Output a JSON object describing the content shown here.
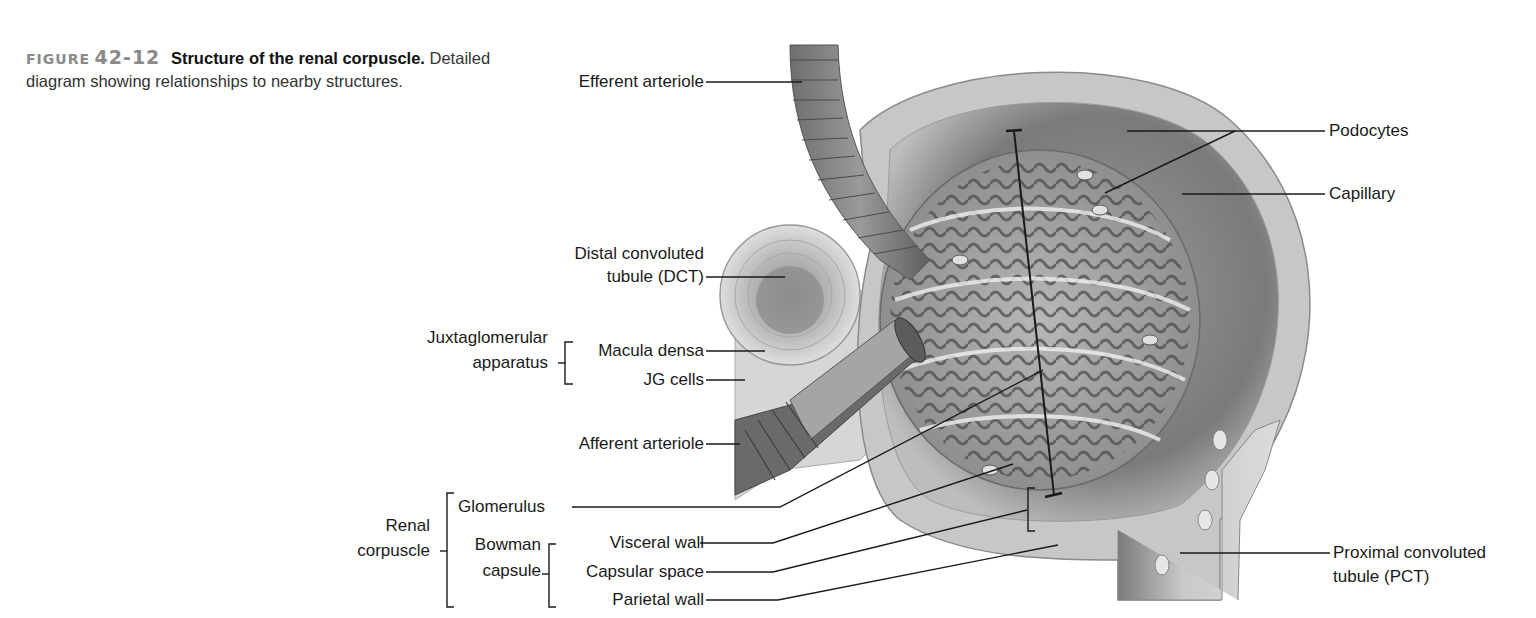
{
  "caption": {
    "figure_label": "FIGURE",
    "figure_number": "42-12",
    "title": "Structure of the renal corpuscle.",
    "description": "Detailed diagram showing relationships to nearby structures."
  },
  "labels": {
    "efferent_arteriole": "Efferent arteriole",
    "dct_line1": "Distal convoluted",
    "dct_line2": "tubule (DCT)",
    "jga_line1": "Juxtaglomerular",
    "jga_line2": "apparatus",
    "macula_densa": "Macula densa",
    "jg_cells": "JG cells",
    "afferent_arteriole": "Afferent arteriole",
    "renal_line1": "Renal",
    "renal_line2": "corpuscle",
    "glomerulus": "Glomerulus",
    "bowman_line1": "Bowman",
    "bowman_line2": "capsule",
    "visceral_wall": "Visceral wall",
    "capsular_space": "Capsular space",
    "parietal_wall": "Parietal wall",
    "podocytes": "Podocytes",
    "capillary": "Capillary",
    "pct_line1": "Proximal convoluted",
    "pct_line2": "tubule (PCT)"
  },
  "colors": {
    "line": "#1a1a1a",
    "tissue_dark": "#5a5a5a",
    "tissue_mid": "#8c8c8c",
    "tissue_light": "#c8c8c8",
    "tissue_pale": "#e2e2e2"
  }
}
